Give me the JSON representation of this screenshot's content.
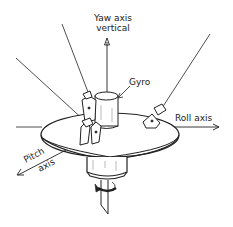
{
  "diagram": {
    "labels": {
      "yaw_line1": "Yaw axis",
      "yaw_line2": "vertical",
      "gyro": "Gyro",
      "roll": "Roll axis",
      "pitch_line1": "Pitch",
      "pitch_line2": "axis"
    },
    "colors": {
      "line": "#222222",
      "background": "#ffffff"
    }
  }
}
